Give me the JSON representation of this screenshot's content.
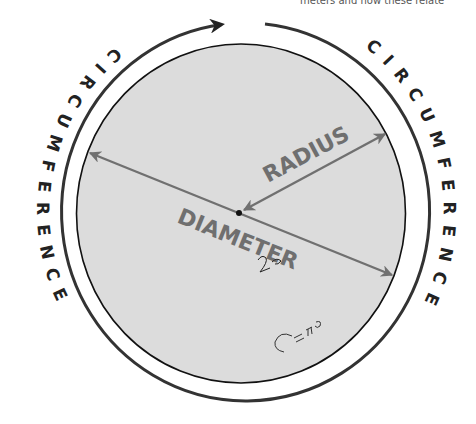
{
  "diagram": {
    "top_clipped_text": "meters and how these relate",
    "labels": {
      "radius": "RADIUS",
      "diameter": "DIAMETER",
      "circumference_left": "CIRCUMFERENCE",
      "circumference_right": "CIRCUMFERENCE"
    },
    "handwriting": {
      "near_diameter": "2r",
      "lower_right": "C=πD"
    },
    "colors": {
      "circle_fill": "#dcdcdc",
      "circle_stroke": "#111111",
      "ring_stroke": "#333333",
      "arrow_gray": "#707070",
      "label_gray": "#6f6f6f",
      "ring_text": "#222222"
    }
  }
}
